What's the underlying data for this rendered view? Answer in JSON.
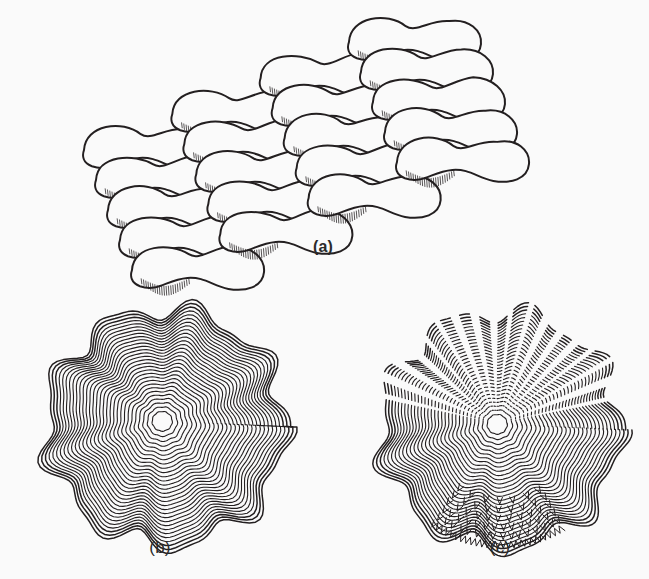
{
  "figure": {
    "background_color": "#fafafa",
    "ink_color": "#231f20",
    "width": 649,
    "height": 579,
    "captions": {
      "a": "(a)",
      "b": "(b)",
      "c": "(c)"
    },
    "panels": [
      {
        "id": "a",
        "label": "(a)",
        "description": "Oblique view of overlapping lobed blob-shaped units arranged in diagonal rows, each unit with a narrow waist and fine hatched fringe along its lower margin",
        "caption_x": 323,
        "caption_y": 246,
        "rows": 5,
        "units_per_row": 4,
        "row_dx": 96,
        "row_dy": -36,
        "col_dx": 82,
        "col_dy": 30,
        "origin_x": 150,
        "origin_y": 150,
        "unit_width": 132,
        "unit_height": 44,
        "hatch_count": 22,
        "hatch_length": 9,
        "stroke_width": 2.0
      },
      {
        "id": "b",
        "label": "(b)",
        "description": "Plan view of a rounded structure built from many concentric irregular wavy growth rings radiating from an off-centre nucleus",
        "caption_x": 160,
        "caption_y": 546,
        "center_x": 162,
        "center_y": 421,
        "ring_count": 30,
        "outer_radius_x": 120,
        "outer_radius_y": 118,
        "lobes": 9,
        "lobe_amplitude": 0.075,
        "stroke_width": 1.1,
        "dashed": false
      },
      {
        "id": "c",
        "label": "(c)",
        "description": "Similar concentric ringed structure with the upper sector broken into a radiating fan of dashed arcs, and a band of chevron spicules with a sawtooth rim along the lower margin",
        "caption_x": 500,
        "caption_y": 546,
        "center_x": 497,
        "center_y": 424,
        "ring_count": 30,
        "outer_radius_x": 120,
        "outer_radius_y": 118,
        "lobes": 9,
        "lobe_amplitude": 0.075,
        "stroke_width": 1.1,
        "fan_start_angle_deg": 196,
        "fan_end_angle_deg": 344,
        "fan_ray_count": 17,
        "chevron_start_angle_deg": 58,
        "chevron_end_angle_deg": 125,
        "chevron_rows": 5,
        "chevron_count": 46,
        "sawtooth_teeth": 26,
        "dashed": true
      }
    ]
  }
}
